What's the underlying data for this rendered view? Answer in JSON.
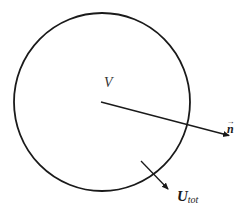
{
  "diagram": {
    "title": "",
    "labels": {
      "volume": "V",
      "normal": "n",
      "normal_arrow_mark": "→",
      "velocity_main": "U",
      "velocity_sub": "tot"
    },
    "colors": {
      "stroke": "#1a1a1a",
      "background": "#ffffff"
    },
    "shapes": {
      "control_volume": {
        "type": "circle",
        "cx": 102,
        "cy": 102,
        "rx": 88,
        "ry": 89
      },
      "normal_vector": {
        "x1": 101,
        "y1": 102,
        "x2": 231,
        "y2": 136
      },
      "velocity_vector": {
        "x1": 141,
        "y1": 161,
        "x2": 170,
        "y2": 191
      }
    }
  }
}
